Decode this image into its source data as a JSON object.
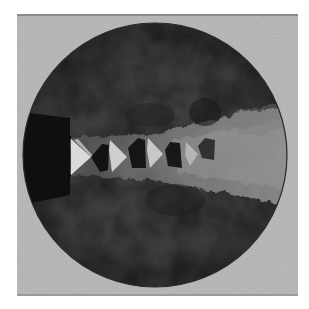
{
  "image": {
    "description": "Schlieren photograph of a supersonic jet exiting a nozzle, showing a train of shock diamonds in a circular field of view",
    "colors": {
      "background": "#ffffff",
      "frame": "#b9b9b9",
      "field": "#3d3d3d",
      "nozzle": "#0f0f0f",
      "shock_bright": "#d6d6d6",
      "shock_dark": "#141414",
      "turbulence": "#8a8a8a"
    },
    "frame": {
      "x": 17,
      "y": 14,
      "width": 281,
      "height": 282
    },
    "field_of_view": {
      "cx": 155,
      "cy": 155,
      "r": 132
    },
    "nozzle": {
      "exit_x": 70,
      "top_y": 112,
      "bottom_y": 200,
      "jet_top_y": 138,
      "jet_bottom_y": 175
    },
    "shock_cells": [
      {
        "x": 71,
        "bright_width": 20,
        "dark_width": 18
      },
      {
        "x": 110,
        "bright_width": 17,
        "dark_width": 18
      },
      {
        "x": 148,
        "bright_width": 15,
        "dark_width": 17
      },
      {
        "x": 188,
        "bright_width": 14,
        "dark_width": 16
      }
    ]
  }
}
